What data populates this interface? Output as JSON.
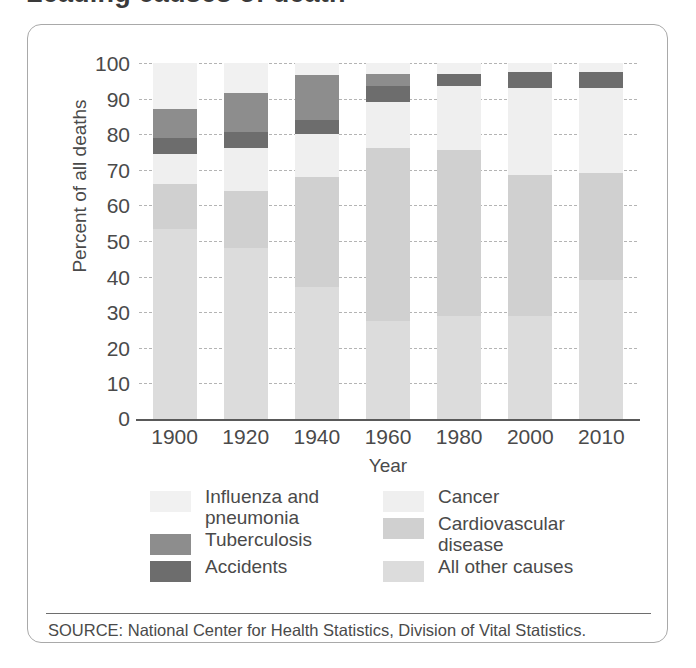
{
  "title_clipped": "Leading causes of death",
  "axes": {
    "ylabel": "Percent of all deaths",
    "xlabel": "Year",
    "yticks": [
      "0",
      "10",
      "20",
      "30",
      "40",
      "50",
      "60",
      "70",
      "80",
      "90",
      "100"
    ]
  },
  "legend": {
    "left": [
      {
        "label": "Influenza and\npneumonia",
        "color": "#f1f1f1"
      },
      {
        "label": "Tuberculosis",
        "color": "#8d8d8d"
      },
      {
        "label": "Accidents",
        "color": "#6d6d6d"
      }
    ],
    "right": [
      {
        "label": "Cancer",
        "color": "#efefef"
      },
      {
        "label": "Cardiovascular\ndisease",
        "color": "#d0d0d0"
      },
      {
        "label": "All other causes",
        "color": "#dcdcdc"
      }
    ]
  },
  "source": "SOURCE: National Center for Health Statistics, Division of Vital Statistics.",
  "chart_data": {
    "type": "bar",
    "stacked": true,
    "title": "Leading causes of death",
    "xlabel": "Year",
    "ylabel": "Percent of all deaths",
    "ylim": [
      0,
      100
    ],
    "yticks": [
      0,
      10,
      20,
      30,
      40,
      50,
      60,
      70,
      80,
      90,
      100
    ],
    "grid": true,
    "legend_position": "bottom",
    "categories": [
      "1900",
      "1920",
      "1940",
      "1960",
      "1980",
      "2000",
      "2010"
    ],
    "series": [
      {
        "name": "All other causes",
        "color": "#dcdcdc",
        "values": [
          53.5,
          48.0,
          37.0,
          27.5,
          29.0,
          29.0,
          39.0
        ]
      },
      {
        "name": "Cardiovascular disease",
        "color": "#d0d0d0",
        "values": [
          12.5,
          16.0,
          31.0,
          48.5,
          46.5,
          39.5,
          30.0
        ]
      },
      {
        "name": "Cancer",
        "color": "#efefef",
        "values": [
          8.5,
          12.0,
          12.0,
          13.0,
          18.0,
          24.5,
          24.0
        ]
      },
      {
        "name": "Accidents",
        "color": "#6d6d6d",
        "values": [
          4.5,
          4.5,
          4.0,
          4.5,
          3.5,
          4.5,
          4.5
        ]
      },
      {
        "name": "Tuberculosis",
        "color": "#8d8d8d",
        "values": [
          8.0,
          11.0,
          12.5,
          3.5,
          0.0,
          0.0,
          0.0
        ]
      },
      {
        "name": "Influenza and pneumonia",
        "color": "#f1f1f1",
        "values": [
          13.0,
          8.5,
          3.5,
          3.0,
          3.0,
          2.5,
          2.5
        ]
      }
    ]
  }
}
